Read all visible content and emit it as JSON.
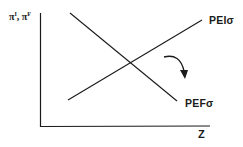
{
  "diagram": {
    "type": "economics-line-diagram",
    "y_axis": {
      "label_base1": "π",
      "label_sup1": "I",
      "label_sep": ", ",
      "label_base2": "π",
      "label_sup2": "F"
    },
    "x_axis": {
      "label": "Z"
    },
    "curves": [
      {
        "id": "PEI",
        "label": "PEIσ",
        "slope": "upward"
      },
      {
        "id": "PEF",
        "label": "PEFσ",
        "slope": "downward"
      }
    ],
    "annotation": {
      "type": "curved-arrow",
      "direction": "clockwise-down"
    },
    "colors": {
      "line": "#1a1a1a",
      "background": "#ffffff"
    }
  }
}
